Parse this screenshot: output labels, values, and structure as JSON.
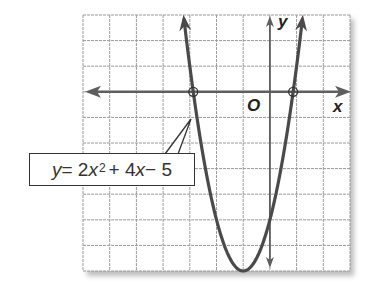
{
  "chart_data": {
    "type": "line",
    "title": "",
    "equation": "y = 2x^2 + 4x - 5",
    "function": {
      "a": 2,
      "b": 4,
      "c": -5
    },
    "xlabel": "x",
    "ylabel": "y",
    "origin_label": "O",
    "xlim": [
      -7,
      3
    ],
    "ylim": [
      -7,
      3
    ],
    "grid": true,
    "grid_step": 1,
    "x_intercepts": [
      -2.87,
      0.87
    ],
    "y_intercept": -5,
    "vertex": [
      -1,
      -7
    ],
    "marked_points": [
      [
        -2.87,
        0
      ],
      [
        0.87,
        0
      ]
    ],
    "series": [
      {
        "name": "y = 2x^2 + 4x - 5",
        "x": [
          -3.24,
          -3,
          -2.87,
          -2.5,
          -2,
          -1.5,
          -1,
          -0.5,
          0,
          0.5,
          0.87,
          1,
          1.24
        ],
        "y": [
          3,
          1,
          0,
          -2.5,
          -5,
          -6.5,
          -7,
          -6.5,
          -5,
          -2.5,
          0,
          1,
          3
        ]
      }
    ]
  },
  "labels": {
    "y_eq": "y",
    "equals": " = 2",
    "x1": "x",
    "exp": "2",
    "plus": "+ 4",
    "x2": "x",
    "minus": " − 5",
    "axis_x": "x",
    "axis_y": "y",
    "origin": "O"
  },
  "colors": {
    "curve": "#4a4a4a",
    "axis": "#5e5e5e",
    "grid": "#9a9a9a",
    "shadow": "#c8c8c8"
  }
}
